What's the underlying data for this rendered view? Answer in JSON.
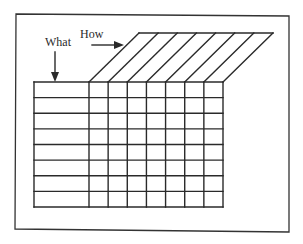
{
  "diagram": {
    "title": "",
    "labels": {
      "what": "What",
      "how": "How"
    },
    "matrix": {
      "what_rows": 8,
      "how_columns": 7
    },
    "colors": {
      "line": "#2a2a2a",
      "background": "#ffffff"
    }
  }
}
